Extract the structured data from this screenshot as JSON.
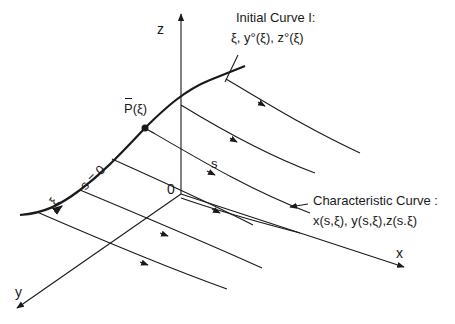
{
  "axes": {
    "z_label": "z",
    "x_label": "x",
    "y_label": "y",
    "origin_label": "0"
  },
  "initial_curve": {
    "title": "Initial Curve I:",
    "equation": "ξ, y°(ξ), z°(ξ)",
    "param_label": "ξ",
    "s0_label": "s = 0"
  },
  "point": {
    "label": "P(ξ)"
  },
  "characteristic_curve": {
    "title": "Characteristic Curve :",
    "equation": "x(s,ξ), y(s,ξ),z(s.ξ)",
    "param_label": "s"
  },
  "colors": {
    "line": "#1a1a1a",
    "background": "#ffffff"
  }
}
